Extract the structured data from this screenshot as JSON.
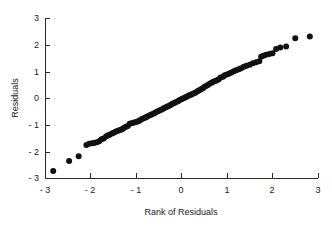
{
  "chart_data": {
    "type": "scatter",
    "title": "",
    "xlabel": "Rank of Residuals",
    "ylabel": "Residuals",
    "xlim": [
      -3,
      3
    ],
    "ylim": [
      -3,
      3
    ],
    "xticks": [
      -3,
      -2,
      -1,
      0,
      1,
      2,
      3
    ],
    "yticks": [
      -3,
      -2,
      -1,
      0,
      1,
      2,
      3
    ],
    "xtick_labels": [
      "- 3",
      "- 2",
      "- 1",
      "0",
      "1",
      "2",
      "3"
    ],
    "ytick_labels": [
      "- 3",
      "- 2",
      "- 1",
      "0",
      "1",
      "2",
      "3"
    ],
    "grid": false,
    "legend": false,
    "legend_position": "none",
    "marker": "circle",
    "marker_color": "#111111",
    "marker_size": 3,
    "background_color": "#ffffff",
    "axis_color": "#2b2b2b",
    "series": [
      {
        "name": "residuals",
        "points": [
          [
            -2.82,
            -2.74
          ],
          [
            -2.47,
            -2.36
          ],
          [
            -2.26,
            -2.18
          ],
          [
            -2.09,
            -1.76
          ],
          [
            -2.03,
            -1.72
          ],
          [
            -1.97,
            -1.7
          ],
          [
            -1.92,
            -1.69
          ],
          [
            -1.86,
            -1.66
          ],
          [
            -1.81,
            -1.62
          ],
          [
            -1.76,
            -1.55
          ],
          [
            -1.71,
            -1.52
          ],
          [
            -1.66,
            -1.44
          ],
          [
            -1.62,
            -1.41
          ],
          [
            -1.58,
            -1.38
          ],
          [
            -1.53,
            -1.33
          ],
          [
            -1.49,
            -1.3
          ],
          [
            -1.45,
            -1.27
          ],
          [
            -1.41,
            -1.24
          ],
          [
            -1.37,
            -1.21
          ],
          [
            -1.33,
            -1.19
          ],
          [
            -1.3,
            -1.16
          ],
          [
            -1.26,
            -1.12
          ],
          [
            -1.22,
            -1.08
          ],
          [
            -1.18,
            -1.05
          ],
          [
            -1.14,
            -0.97
          ],
          [
            -1.1,
            -0.95
          ],
          [
            -1.06,
            -0.93
          ],
          [
            -1.02,
            -0.91
          ],
          [
            -0.98,
            -0.89
          ],
          [
            -0.94,
            -0.86
          ],
          [
            -0.91,
            -0.83
          ],
          [
            -0.87,
            -0.79
          ],
          [
            -0.83,
            -0.76
          ],
          [
            -0.79,
            -0.73
          ],
          [
            -0.76,
            -0.7
          ],
          [
            -0.72,
            -0.67
          ],
          [
            -0.68,
            -0.64
          ],
          [
            -0.65,
            -0.61
          ],
          [
            -0.61,
            -0.58
          ],
          [
            -0.58,
            -0.55
          ],
          [
            -0.54,
            -0.52
          ],
          [
            -0.51,
            -0.49
          ],
          [
            -0.47,
            -0.46
          ],
          [
            -0.44,
            -0.43
          ],
          [
            -0.4,
            -0.4
          ],
          [
            -0.37,
            -0.37
          ],
          [
            -0.33,
            -0.34
          ],
          [
            -0.3,
            -0.31
          ],
          [
            -0.26,
            -0.28
          ],
          [
            -0.23,
            -0.25
          ],
          [
            -0.2,
            -0.22
          ],
          [
            -0.16,
            -0.19
          ],
          [
            -0.13,
            -0.16
          ],
          [
            -0.09,
            -0.13
          ],
          [
            -0.06,
            -0.1
          ],
          [
            -0.03,
            -0.07
          ],
          [
            0.01,
            -0.04
          ],
          [
            0.04,
            -0.01
          ],
          [
            0.08,
            0.02
          ],
          [
            0.11,
            0.05
          ],
          [
            0.15,
            0.08
          ],
          [
            0.18,
            0.1
          ],
          [
            0.22,
            0.13
          ],
          [
            0.25,
            0.16
          ],
          [
            0.29,
            0.19
          ],
          [
            0.32,
            0.22
          ],
          [
            0.36,
            0.26
          ],
          [
            0.39,
            0.29
          ],
          [
            0.43,
            0.33
          ],
          [
            0.47,
            0.37
          ],
          [
            0.5,
            0.41
          ],
          [
            0.54,
            0.45
          ],
          [
            0.58,
            0.49
          ],
          [
            0.62,
            0.53
          ],
          [
            0.66,
            0.57
          ],
          [
            0.7,
            0.61
          ],
          [
            0.74,
            0.64
          ],
          [
            0.78,
            0.67
          ],
          [
            0.82,
            0.7
          ],
          [
            0.86,
            0.77
          ],
          [
            0.91,
            0.8
          ],
          [
            0.95,
            0.85
          ],
          [
            1.0,
            0.88
          ],
          [
            1.05,
            0.92
          ],
          [
            1.1,
            0.96
          ],
          [
            1.15,
            1.0
          ],
          [
            1.2,
            1.04
          ],
          [
            1.26,
            1.08
          ],
          [
            1.31,
            1.12
          ],
          [
            1.37,
            1.17
          ],
          [
            1.43,
            1.21
          ],
          [
            1.5,
            1.25
          ],
          [
            1.57,
            1.3
          ],
          [
            1.64,
            1.34
          ],
          [
            1.71,
            1.38
          ],
          [
            1.75,
            1.55
          ],
          [
            1.8,
            1.58
          ],
          [
            1.86,
            1.62
          ],
          [
            1.93,
            1.65
          ],
          [
            2.0,
            1.68
          ],
          [
            2.08,
            1.84
          ],
          [
            2.17,
            1.89
          ],
          [
            2.3,
            1.93
          ],
          [
            2.5,
            2.24
          ],
          [
            2.82,
            2.31
          ]
        ]
      }
    ]
  }
}
